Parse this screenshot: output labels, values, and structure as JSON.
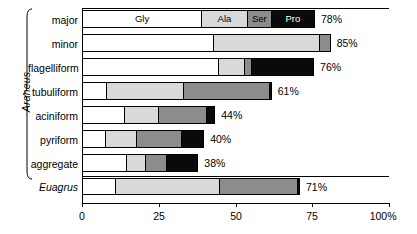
{
  "chart_data": {
    "type": "bar",
    "orientation": "horizontal",
    "stacked": true,
    "title": "",
    "xlabel": "",
    "ylabel": "",
    "xlim": [
      0,
      100
    ],
    "grid": false,
    "legend_position": "in-bar (first row segment labels)",
    "axis": {
      "ticks": [
        0,
        25,
        50,
        75,
        100
      ],
      "tick_labels": [
        "0",
        "25",
        "50",
        "75",
        "100%"
      ]
    },
    "series": [
      {
        "name": "Gly",
        "label": "Gly",
        "color": "#ffffff"
      },
      {
        "name": "Ala",
        "label": "Ala",
        "color": "#d9d9d9"
      },
      {
        "name": "Ser",
        "label": "Ser",
        "color": "#8c8c8c"
      },
      {
        "name": "Pro",
        "label": "Pro",
        "color": "#0a0a0a"
      }
    ],
    "categories": [
      "major",
      "minor",
      "flagelliform",
      "tubuliform",
      "aciniform",
      "pyriform",
      "aggregate",
      "Euagrus"
    ],
    "rows": [
      {
        "label": "major",
        "italic": false,
        "total_label": "78%",
        "total": 78,
        "segments": [
          {
            "name": "Gly",
            "value": 38.8,
            "seg_label": "Gly"
          },
          {
            "name": "Ala",
            "value": 14.9,
            "seg_label": "Ala"
          },
          {
            "name": "Ser",
            "value": 7.8,
            "seg_label": "Ser"
          },
          {
            "name": "Pro",
            "value": 14.4,
            "seg_label": "Pro"
          }
        ]
      },
      {
        "label": "minor",
        "italic": false,
        "total_label": "85%",
        "total": 85,
        "segments": [
          {
            "name": "Gly",
            "value": 42.7,
            "seg_label": ""
          },
          {
            "name": "Ala",
            "value": 34.5,
            "seg_label": ""
          },
          {
            "name": "Ser",
            "value": 3.8,
            "seg_label": ""
          },
          {
            "name": "Pro",
            "value": 0,
            "seg_label": ""
          }
        ]
      },
      {
        "label": "flagelliform",
        "italic": false,
        "total_label": "76%",
        "total": 76,
        "segments": [
          {
            "name": "Gly",
            "value": 44.4,
            "seg_label": ""
          },
          {
            "name": "Ala",
            "value": 8.3,
            "seg_label": ""
          },
          {
            "name": "Ser",
            "value": 2.3,
            "seg_label": ""
          },
          {
            "name": "Pro",
            "value": 20.6,
            "seg_label": ""
          }
        ]
      },
      {
        "label": "tubuliform",
        "italic": false,
        "total_label": "61%",
        "total": 61,
        "segments": [
          {
            "name": "Gly",
            "value": 7.9,
            "seg_label": ""
          },
          {
            "name": "Ala",
            "value": 25.1,
            "seg_label": ""
          },
          {
            "name": "Ser",
            "value": 27.8,
            "seg_label": ""
          },
          {
            "name": "Pro",
            "value": 1.0,
            "seg_label": ""
          }
        ]
      },
      {
        "label": "aciniform",
        "italic": false,
        "total_label": "44%",
        "total": 44,
        "segments": [
          {
            "name": "Gly",
            "value": 13.7,
            "seg_label": ""
          },
          {
            "name": "Ala",
            "value": 11.0,
            "seg_label": ""
          },
          {
            "name": "Ser",
            "value": 15.8,
            "seg_label": ""
          },
          {
            "name": "Pro",
            "value": 2.9,
            "seg_label": ""
          }
        ]
      },
      {
        "label": "pyriform",
        "italic": false,
        "total_label": "40%",
        "total": 40,
        "segments": [
          {
            "name": "Gly",
            "value": 7.6,
            "seg_label": ""
          },
          {
            "name": "Ala",
            "value": 10.0,
            "seg_label": ""
          },
          {
            "name": "Ser",
            "value": 14.8,
            "seg_label": ""
          },
          {
            "name": "Pro",
            "value": 7.4,
            "seg_label": ""
          }
        ]
      },
      {
        "label": "aggregate",
        "italic": false,
        "total_label": "38%",
        "total": 38,
        "segments": [
          {
            "name": "Gly",
            "value": 14.4,
            "seg_label": ""
          },
          {
            "name": "Ala",
            "value": 6.1,
            "seg_label": ""
          },
          {
            "name": "Ser",
            "value": 6.8,
            "seg_label": ""
          },
          {
            "name": "Pro",
            "value": 10.6,
            "seg_label": ""
          }
        ]
      },
      {
        "label": "Euagrus",
        "italic": true,
        "total_label": "71%",
        "total": 71,
        "segments": [
          {
            "name": "Gly",
            "value": 10.8,
            "seg_label": ""
          },
          {
            "name": "Ala",
            "value": 33.9,
            "seg_label": ""
          },
          {
            "name": "Ser",
            "value": 25.5,
            "seg_label": ""
          },
          {
            "name": "Pro",
            "value": 0.8,
            "seg_label": ""
          }
        ]
      }
    ],
    "group_bracket": {
      "label": "Araneus",
      "italic": true,
      "covers": [
        "major",
        "minor",
        "flagelliform",
        "tubuliform",
        "aciniform",
        "pyriform",
        "aggregate"
      ]
    }
  }
}
